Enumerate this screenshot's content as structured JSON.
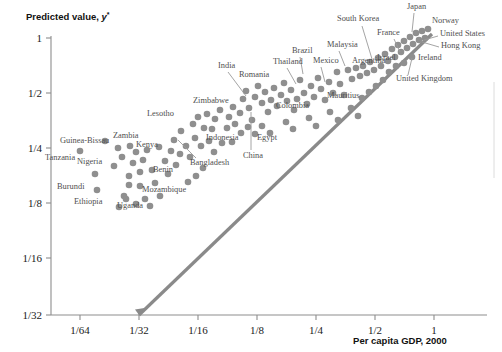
{
  "figure": {
    "background": "#ffffff",
    "dot_color": "#8f8f8f",
    "line_color": "#8a8a8a",
    "axis_color": "#8d8d8d",
    "label_color": "#4f4f4f"
  },
  "axes": {
    "y_title_prefix": "Predicted value,",
    "y_title_var": "y",
    "y_title_star": "*",
    "x_title": "Per capita GDP, 2000"
  },
  "chart_data": {
    "type": "scatter",
    "title": "",
    "xlabel": "Per capita GDP, 2000",
    "ylabel": "Predicted value, y*",
    "xscale": "log2",
    "yscale": "log2",
    "xlim": [
      0.015625,
      1.6
    ],
    "ylim": [
      0.03125,
      1.0
    ],
    "grid": false,
    "legend": null,
    "x_ticks": [
      {
        "value": 0.015625,
        "label": "1/64",
        "px": 80
      },
      {
        "value": 0.03125,
        "label": "1/32",
        "px": 139
      },
      {
        "value": 0.0625,
        "label": "1/16",
        "px": 198
      },
      {
        "value": 0.125,
        "label": "1/8",
        "px": 257
      },
      {
        "value": 0.25,
        "label": "1/4",
        "px": 316
      },
      {
        "value": 0.5,
        "label": "1/2",
        "px": 375
      },
      {
        "value": 1.0,
        "label": "1",
        "px": 434
      }
    ],
    "y_ticks": [
      {
        "value": 1.0,
        "label": "1",
        "px": 38
      },
      {
        "value": 0.5,
        "label": "1/2",
        "px": 93
      },
      {
        "value": 0.25,
        "label": "1/4",
        "px": 148
      },
      {
        "value": 0.125,
        "label": "1/8",
        "px": 203
      },
      {
        "value": 0.0625,
        "label": "1/16",
        "px": 258
      },
      {
        "value": 0.03125,
        "label": "1/32",
        "px": 315
      }
    ],
    "reference_line": {
      "name": "45-degree line",
      "from": [
        0.03125,
        0.03125
      ],
      "to": [
        1.15,
        1.15
      ],
      "px_from": [
        139,
        315
      ],
      "px_to": [
        432,
        34
      ]
    },
    "points": [
      {
        "px": [
          80,
          151
        ]
      },
      {
        "px": [
          95,
          174
        ]
      },
      {
        "px": [
          105,
          141
        ]
      },
      {
        "px": [
          97,
          190
        ]
      },
      {
        "px": [
          114,
          166
        ]
      },
      {
        "px": [
          122,
          157
        ]
      },
      {
        "px": [
          124,
          196
        ]
      },
      {
        "px": [
          118,
          148
        ]
      },
      {
        "px": [
          130,
          146
        ]
      },
      {
        "px": [
          136,
          152
        ]
      },
      {
        "px": [
          133,
          163
        ]
      },
      {
        "px": [
          129,
          176
        ]
      },
      {
        "px": [
          140,
          172
        ]
      },
      {
        "px": [
          143,
          160
        ]
      },
      {
        "px": [
          119,
          207
        ]
      },
      {
        "px": [
          129,
          185
        ]
      },
      {
        "px": [
          140,
          186
        ]
      },
      {
        "px": [
          147,
          150
        ]
      },
      {
        "px": [
          152,
          170
        ]
      },
      {
        "px": [
          155,
          183
        ]
      },
      {
        "px": [
          126,
          199
        ]
      },
      {
        "px": [
          136,
          204
        ]
      },
      {
        "px": [
          145,
          199
        ]
      },
      {
        "px": [
          150,
          206
        ]
      },
      {
        "px": [
          160,
          196
        ]
      },
      {
        "px": [
          159,
          147
        ]
      },
      {
        "px": [
          165,
          161
        ]
      },
      {
        "px": [
          171,
          151
        ]
      },
      {
        "px": [
          174,
          140
        ]
      },
      {
        "px": [
          181,
          131
        ]
      },
      {
        "px": [
          168,
          174
        ]
      },
      {
        "px": [
          176,
          165
        ]
      },
      {
        "px": [
          180,
          154
        ]
      },
      {
        "px": [
          186,
          146
        ]
      },
      {
        "px": [
          190,
          157
        ]
      },
      {
        "px": [
          195,
          138
        ]
      },
      {
        "px": [
          193,
          124
        ]
      },
      {
        "px": [
          198,
          117
        ]
      },
      {
        "px": [
          204,
          128
        ]
      },
      {
        "px": [
          207,
          114
        ]
      },
      {
        "px": [
          201,
          146
        ]
      },
      {
        "px": [
          209,
          141
        ]
      },
      {
        "px": [
          212,
          129
        ]
      },
      {
        "px": [
          215,
          119
        ]
      },
      {
        "px": [
          220,
          110
        ]
      },
      {
        "px": [
          214,
          152
        ]
      },
      {
        "px": [
          222,
          143
        ]
      },
      {
        "px": [
          227,
          128
        ]
      },
      {
        "px": [
          229,
          117
        ]
      },
      {
        "px": [
          233,
          107
        ]
      },
      {
        "px": [
          235,
          124
        ]
      },
      {
        "px": [
          240,
          113
        ]
      },
      {
        "px": [
          243,
          99
        ]
      },
      {
        "px": [
          246,
          91
        ]
      },
      {
        "px": [
          249,
          108
        ]
      },
      {
        "px": [
          252,
          120
        ]
      },
      {
        "px": [
          255,
          97
        ]
      },
      {
        "px": [
          258,
          86
        ]
      },
      {
        "px": [
          262,
          103
        ]
      },
      {
        "px": [
          265,
          92
        ]
      },
      {
        "px": [
          268,
          112
        ]
      },
      {
        "px": [
          271,
          100
        ]
      },
      {
        "px": [
          274,
          88
        ]
      },
      {
        "px": [
          277,
          106
        ]
      },
      {
        "px": [
          281,
          95
        ]
      },
      {
        "px": [
          284,
          83
        ]
      },
      {
        "px": [
          287,
          101
        ]
      },
      {
        "px": [
          291,
          90
        ]
      },
      {
        "px": [
          294,
          110
        ]
      },
      {
        "px": [
          297,
          99
        ]
      },
      {
        "px": [
          300,
          80
        ]
      },
      {
        "px": [
          304,
          93
        ]
      },
      {
        "px": [
          307,
          104
        ]
      },
      {
        "px": [
          311,
          86
        ]
      },
      {
        "px": [
          314,
          97
        ]
      },
      {
        "px": [
          318,
          78
        ]
      },
      {
        "px": [
          321,
          89
        ]
      },
      {
        "px": [
          325,
          100
        ]
      },
      {
        "px": [
          329,
          82
        ]
      },
      {
        "px": [
          333,
          93
        ]
      },
      {
        "px": [
          337,
          72
        ]
      },
      {
        "px": [
          340,
          84
        ]
      },
      {
        "px": [
          344,
          95
        ]
      },
      {
        "px": [
          348,
          70
        ]
      },
      {
        "px": [
          352,
          79
        ]
      },
      {
        "px": [
          356,
          68
        ]
      },
      {
        "px": [
          360,
          76
        ]
      },
      {
        "px": [
          363,
          66
        ]
      },
      {
        "px": [
          367,
          73
        ]
      },
      {
        "px": [
          370,
          62
        ]
      },
      {
        "px": [
          374,
          70
        ]
      },
      {
        "px": [
          378,
          58
        ]
      },
      {
        "px": [
          381,
          66
        ]
      },
      {
        "px": [
          385,
          54
        ]
      },
      {
        "px": [
          388,
          61
        ]
      },
      {
        "px": [
          392,
          49
        ]
      },
      {
        "px": [
          395,
          57
        ]
      },
      {
        "px": [
          398,
          45
        ]
      },
      {
        "px": [
          401,
          52
        ]
      },
      {
        "px": [
          404,
          41
        ]
      },
      {
        "px": [
          407,
          48
        ]
      },
      {
        "px": [
          410,
          37
        ]
      },
      {
        "px": [
          413,
          44
        ]
      },
      {
        "px": [
          416,
          33
        ]
      },
      {
        "px": [
          419,
          40
        ]
      },
      {
        "px": [
          422,
          31
        ]
      },
      {
        "px": [
          425,
          38
        ]
      },
      {
        "px": [
          428,
          29
        ]
      },
      {
        "px": [
          396,
          66
        ]
      },
      {
        "px": [
          404,
          63
        ]
      },
      {
        "px": [
          412,
          57
        ]
      },
      {
        "px": [
          389,
          72
        ]
      },
      {
        "px": [
          383,
          80
        ]
      },
      {
        "px": [
          376,
          86
        ]
      },
      {
        "px": [
          369,
          92
        ]
      },
      {
        "px": [
          362,
          98
        ]
      },
      {
        "px": [
          241,
          133
        ]
      },
      {
        "px": [
          248,
          127
        ]
      },
      {
        "px": [
          255,
          134
        ]
      },
      {
        "px": [
          188,
          182
        ]
      },
      {
        "px": [
          196,
          176
        ]
      },
      {
        "px": [
          203,
          168
        ]
      },
      {
        "px": [
          232,
          142
        ]
      },
      {
        "px": [
          262,
          126
        ]
      },
      {
        "px": [
          270,
          133
        ]
      },
      {
        "px": [
          286,
          122
        ]
      },
      {
        "px": [
          293,
          129
        ]
      },
      {
        "px": [
          309,
          118
        ]
      },
      {
        "px": [
          316,
          126
        ]
      },
      {
        "px": [
          330,
          112
        ]
      },
      {
        "px": [
          338,
          120
        ]
      },
      {
        "px": [
          351,
          108
        ]
      },
      {
        "px": [
          358,
          116
        ]
      }
    ],
    "annotations": [
      {
        "label": "Tanzania",
        "px": [
          45,
          160
        ],
        "anchor": "start",
        "leader": null
      },
      {
        "label": "Guinea-Bissau",
        "px": [
          60,
          143
        ],
        "anchor": "start",
        "leader": null
      },
      {
        "label": "Nigeria",
        "px": [
          77,
          164
        ],
        "anchor": "start",
        "leader": null
      },
      {
        "label": "Burundi",
        "px": [
          57,
          189
        ],
        "anchor": "start",
        "leader": null
      },
      {
        "label": "Ethiopia",
        "px": [
          74,
          204
        ],
        "anchor": "start",
        "leader": null
      },
      {
        "label": "Zambia",
        "px": [
          113,
          138
        ],
        "anchor": "start",
        "leader": null
      },
      {
        "label": "Kenya",
        "px": [
          136,
          147
        ],
        "anchor": "start",
        "leader": null
      },
      {
        "label": "Uganda",
        "px": [
          117,
          208
        ],
        "anchor": "start",
        "leader": null
      },
      {
        "label": "Mozambique",
        "px": [
          142,
          192
        ],
        "anchor": "start",
        "leader": null
      },
      {
        "label": "Benin",
        "px": [
          153,
          172
        ],
        "anchor": "start",
        "leader": null
      },
      {
        "label": "Lesotho",
        "px": [
          147,
          116
        ],
        "anchor": "start",
        "leader": null
      },
      {
        "label": "Bangladesh",
        "px": [
          190,
          165
        ],
        "anchor": "start",
        "leader": [
          [
            196,
            158
          ],
          [
            178,
            140
          ]
        ]
      },
      {
        "label": "Zimbabwe",
        "px": [
          193,
          103
        ],
        "anchor": "start",
        "leader": null
      },
      {
        "label": "Indonesia",
        "px": [
          206,
          140
        ],
        "anchor": "start",
        "leader": null
      },
      {
        "label": "India",
        "px": [
          218,
          68
        ],
        "anchor": "start",
        "leader": [
          [
            228,
            72
          ],
          [
            246,
            96
          ]
        ]
      },
      {
        "label": "China",
        "px": [
          243,
          158
        ],
        "anchor": "start",
        "leader": [
          [
            251,
            150
          ],
          [
            251,
            112
          ]
        ]
      },
      {
        "label": "Romania",
        "px": [
          239,
          77
        ],
        "anchor": "start",
        "leader": null
      },
      {
        "label": "Egypt",
        "px": [
          257,
          140
        ],
        "anchor": "start",
        "leader": null
      },
      {
        "label": "Colombia",
        "px": [
          276,
          108
        ],
        "anchor": "start",
        "leader": null
      },
      {
        "label": "Thailand",
        "px": [
          273,
          64
        ],
        "anchor": "start",
        "leader": [
          [
            287,
            68
          ],
          [
            296,
            84
          ]
        ]
      },
      {
        "label": "Brazil",
        "px": [
          292,
          53
        ],
        "anchor": "start",
        "leader": [
          [
            300,
            57
          ],
          [
            303,
            74
          ]
        ]
      },
      {
        "label": "Mexico",
        "px": [
          313,
          63
        ],
        "anchor": "start",
        "leader": [
          [
            321,
            67
          ],
          [
            325,
            82
          ]
        ]
      },
      {
        "label": "Malaysia",
        "px": [
          327,
          47
        ],
        "anchor": "start",
        "leader": [
          [
            339,
            51
          ],
          [
            345,
            66
          ]
        ]
      },
      {
        "label": "Argentina",
        "px": [
          352,
          63
        ],
        "anchor": "start",
        "leader": null
      },
      {
        "label": "Mauritius",
        "px": [
          327,
          98
        ],
        "anchor": "start",
        "leader": null
      },
      {
        "label": "South Korea",
        "px": [
          337,
          21
        ],
        "anchor": "start",
        "leader": [
          [
            362,
            26
          ],
          [
            372,
            59
          ]
        ]
      },
      {
        "label": "France",
        "px": [
          377,
          35
        ],
        "anchor": "start",
        "leader": [
          [
            394,
            39
          ],
          [
            400,
            52
          ]
        ]
      },
      {
        "label": "Israel",
        "px": [
          377,
          60
        ],
        "anchor": "start",
        "leader": null
      },
      {
        "label": "Japan",
        "px": [
          407,
          9
        ],
        "anchor": "start",
        "leader": [
          [
            414,
            13
          ],
          [
            412,
            32
          ]
        ]
      },
      {
        "label": "Norway",
        "px": [
          432,
          23
        ],
        "anchor": "start",
        "leader": null
      },
      {
        "label": "United States",
        "px": [
          440,
          36
        ],
        "anchor": "start",
        "leader": [
          [
            438,
            36
          ],
          [
            424,
            40
          ]
        ]
      },
      {
        "label": "Hong Kong",
        "px": [
          441,
          48
        ],
        "anchor": "start",
        "leader": [
          [
            439,
            47
          ],
          [
            422,
            42
          ]
        ]
      },
      {
        "label": "Ireland",
        "px": [
          418,
          60
        ],
        "anchor": "start",
        "leader": null
      },
      {
        "label": "United Kingdom",
        "px": [
          396,
          81
        ],
        "anchor": "start",
        "leader": [
          [
            408,
            75
          ],
          [
            412,
            58
          ]
        ]
      }
    ]
  }
}
